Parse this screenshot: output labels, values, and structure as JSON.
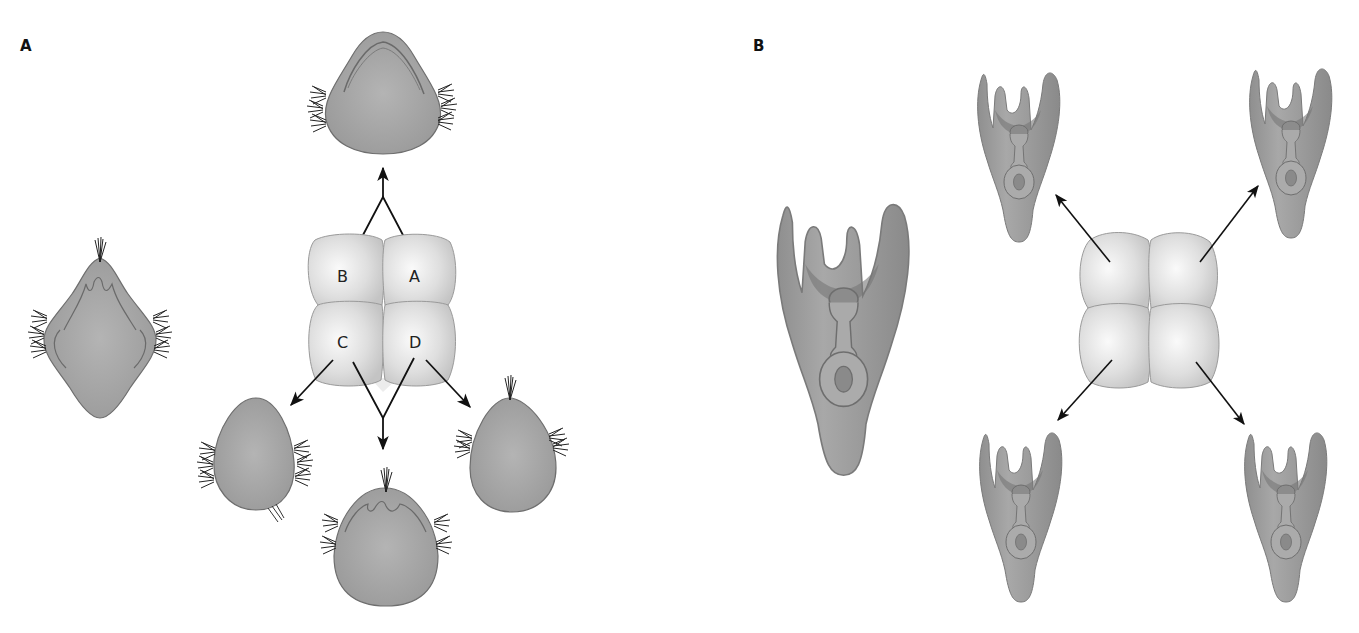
{
  "figure": {
    "panels": [
      {
        "label": "A",
        "description": "Mosaic development: isolated blastomeres each form a partial larva",
        "blastomeres": [
          "A",
          "B",
          "C",
          "D"
        ],
        "whole_larva": "ciliated trochophore-like larva",
        "outcomes": [
          {
            "from": [
              "A",
              "B"
            ],
            "result": "upper partial larva with ciliary band"
          },
          {
            "from": [
              "C"
            ],
            "result": "partial larva (ovoid, lateral cilia)"
          },
          {
            "from": [
              "C",
              "D"
            ],
            "result": "partial larva with apical tuft"
          },
          {
            "from": [
              "D"
            ],
            "result": "partial larva with apical tuft"
          }
        ]
      },
      {
        "label": "B",
        "description": "Regulative development: each isolated blastomere forms a complete but smaller larva",
        "whole_larva": "complete pluteus-like larva",
        "outcomes": [
          {
            "from": "upper-left",
            "result": "complete small larva"
          },
          {
            "from": "upper-right",
            "result": "complete small larva"
          },
          {
            "from": "lower-left",
            "result": "complete small larva"
          },
          {
            "from": "lower-right",
            "result": "complete small larva"
          }
        ]
      }
    ],
    "colors": {
      "larva_fill": "#9a9a9a",
      "larva_stroke": "#6e6e6e",
      "blastomere_fill": "#dcdcdc",
      "blastomere_highlight": "#f7f7f7",
      "arrow": "#111111",
      "background": "#ffffff"
    }
  }
}
